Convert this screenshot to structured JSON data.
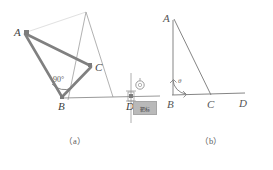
{
  "document": {
    "kind": "geometry-figure",
    "subfigures": 2
  },
  "palette": {
    "stroke": "#8a8a8a",
    "stroke_dark": "#6b6b6b",
    "thick_stroke": "#7b7b7b",
    "marker": "#7c7c7c",
    "text": "#4a4a4a",
    "plate_fill": "#b9b9b9",
    "background": "#ffffff"
  },
  "figure_a": {
    "caption": "（a）",
    "points": [
      {
        "name": "A",
        "label": "A",
        "x": 22,
        "y": 32,
        "has_marker": true
      },
      {
        "name": "B",
        "label": "B",
        "x": 62,
        "y": 98,
        "has_marker": true
      },
      {
        "name": "C",
        "label": "C",
        "x": 92,
        "y": 66,
        "has_marker": true
      },
      {
        "name": "D",
        "label": "D",
        "x": 131,
        "y": 98,
        "has_marker": true
      }
    ],
    "angle": {
      "vertex": "B",
      "value": "90",
      "unit": "°",
      "label": "90°"
    },
    "plate": {
      "label": "靶标",
      "x": 133,
      "y": 101,
      "width": 22,
      "height": 12
    },
    "segments": [
      {
        "from": "A",
        "to": "B",
        "style": "thick"
      },
      {
        "from": "A",
        "to": "C",
        "style": "thick"
      },
      {
        "from": "B",
        "to": "C",
        "style": "thick"
      },
      {
        "from": "B",
        "to": "D",
        "style": "thin"
      },
      {
        "from": "A",
        "to": "sight-top",
        "style": "thin"
      },
      {
        "from": "B",
        "to": "sight-top",
        "style": "thin"
      },
      {
        "from": "sight-top",
        "to": "ground",
        "style": "thin"
      }
    ]
  },
  "figure_b": {
    "caption": "（b）",
    "points": [
      {
        "name": "A",
        "label": "A",
        "x": 173,
        "y": 18,
        "has_marker": false
      },
      {
        "name": "B",
        "label": "B",
        "x": 173,
        "y": 96,
        "has_marker": false
      },
      {
        "name": "C",
        "label": "C",
        "x": 211,
        "y": 96,
        "has_marker": false
      },
      {
        "name": "D",
        "label": "D",
        "x": 243,
        "y": 96,
        "has_marker": false
      }
    ],
    "angle": {
      "vertex": "B",
      "label": "θ"
    },
    "segments": [
      {
        "from": "A",
        "to": "B",
        "style": "thin"
      },
      {
        "from": "A",
        "to": "C",
        "style": "thin"
      },
      {
        "from": "B",
        "to": "D",
        "style": "thin"
      }
    ]
  }
}
